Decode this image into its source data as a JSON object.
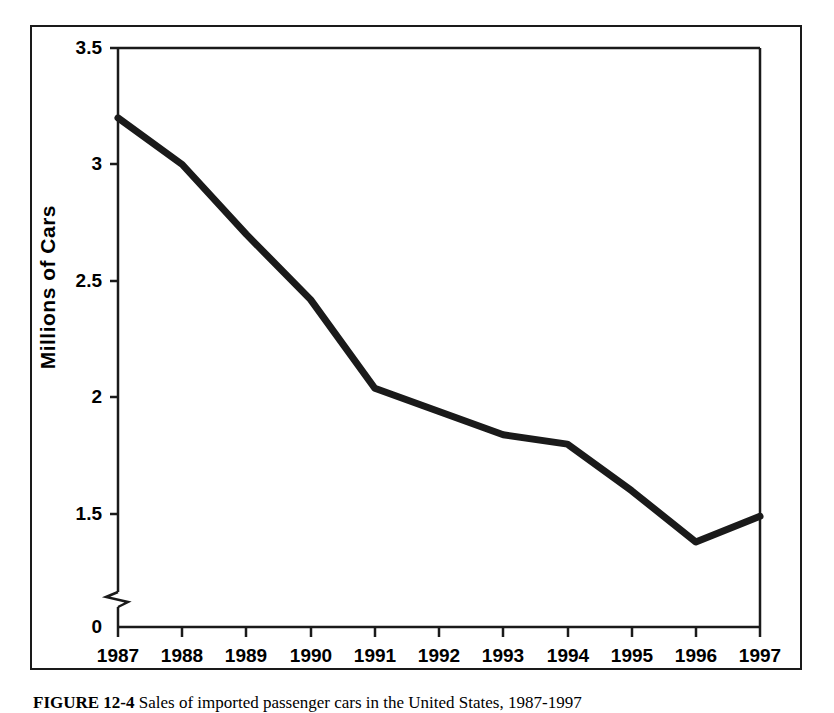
{
  "figure": {
    "caption_label": "FIGURE 12-4",
    "caption_text": "Sales of imported passenger cars in the United States, 1987-1997"
  },
  "chart_data": {
    "type": "line",
    "title": "",
    "xlabel": "",
    "ylabel": "Millions of Cars",
    "categories": [
      "1987",
      "1988",
      "1989",
      "1990",
      "1991",
      "1992",
      "1993",
      "1994",
      "1995",
      "1996",
      "1997"
    ],
    "values": [
      3.2,
      3.0,
      2.7,
      2.42,
      2.04,
      1.94,
      1.84,
      1.8,
      1.6,
      1.38,
      1.49
    ],
    "y_tick_labels": [
      "0",
      "1.5",
      "2",
      "2.5",
      "3",
      "3.5"
    ],
    "y_tick_values": [
      0,
      1.5,
      2,
      2.5,
      3,
      3.5
    ],
    "ylim": [
      1.5,
      3.5
    ],
    "axis_break": true,
    "axis_break_note": "y-axis broken between 0 and 1.5",
    "grid": false,
    "legend": "none",
    "line_color": "#1a1a1a",
    "line_width": 7,
    "axis_color": "#1a1a1a",
    "background_color": "#ffffff"
  }
}
